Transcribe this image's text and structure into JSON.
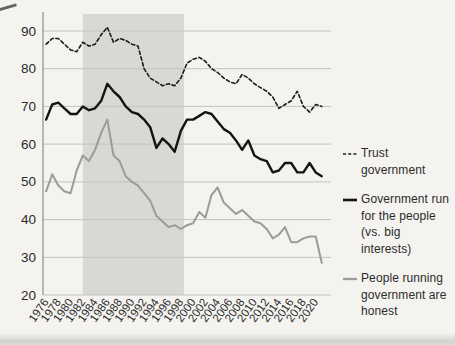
{
  "chart_data": {
    "type": "line",
    "x": [
      1976,
      1977,
      1978,
      1979,
      1980,
      1981,
      1982,
      1983,
      1984,
      1985,
      1986,
      1987,
      1988,
      1989,
      1990,
      1991,
      1992,
      1993,
      1994,
      1995,
      1996,
      1997,
      1998,
      1999,
      2000,
      2001,
      2002,
      2003,
      2004,
      2005,
      2006,
      2007,
      2008,
      2009,
      2010,
      2011,
      2012,
      2013,
      2014,
      2015,
      2016,
      2017,
      2018,
      2019,
      2020,
      2021
    ],
    "xticks": [
      1976,
      1978,
      1980,
      1982,
      1984,
      1986,
      1988,
      1990,
      1992,
      1994,
      1996,
      1998,
      2000,
      2002,
      2004,
      2006,
      2008,
      2010,
      2012,
      2014,
      2016,
      2018,
      2020
    ],
    "yticks": [
      20,
      30,
      40,
      50,
      60,
      70,
      80,
      90
    ],
    "xlim": [
      1975.5,
      2022.5
    ],
    "ylim": [
      20,
      90
    ],
    "grid": true,
    "legend_position": "right",
    "title": "",
    "xlabel": "",
    "ylabel": "",
    "shaded_band": {
      "from": 1982,
      "to": 1998.5,
      "color": "#d9d8d4"
    },
    "colors": {
      "background": "#f4f3f0",
      "grid": "#c3c2bf",
      "axis": "#96958f",
      "tick_text": "#2a2a2a"
    },
    "series": [
      {
        "id": "trust-government",
        "name": "Trust government",
        "style": "dashed",
        "color": "#1c1c1c",
        "values": [
          86.5,
          88,
          88,
          86.5,
          85,
          84.5,
          87,
          86,
          86.5,
          89,
          91,
          87,
          88,
          87.5,
          86.5,
          86,
          80,
          77.5,
          76.5,
          75.5,
          76,
          75.5,
          77.5,
          81.5,
          82.5,
          83,
          82,
          80,
          79,
          77.5,
          76.5,
          76,
          78.5,
          77.5,
          76,
          75,
          74,
          72.5,
          69.5,
          70.5,
          71.5,
          74,
          70,
          68.5,
          70.5,
          70
        ]
      },
      {
        "id": "government-run-for-people",
        "name": "Government run for the people (vs. big interests)",
        "style": "solid",
        "color": "#141414",
        "values": [
          66.5,
          70.5,
          71,
          69.5,
          68,
          68,
          70,
          69,
          69.5,
          71.5,
          76,
          74,
          72.5,
          70,
          68.5,
          68,
          66.5,
          64.5,
          59,
          61.5,
          60,
          58,
          63.5,
          66.5,
          66.5,
          67.5,
          68.5,
          68,
          66,
          64,
          63,
          61,
          58.5,
          61,
          57,
          56,
          55.5,
          52.5,
          53,
          55,
          55,
          52.5,
          52.5,
          55,
          52.5,
          51.5
        ]
      },
      {
        "id": "people-running-government-honest",
        "name": "People running government are honest",
        "style": "solid",
        "color": "#9c9b99",
        "values": [
          47.5,
          52,
          49,
          47.5,
          47,
          53,
          57,
          55.5,
          58.5,
          63,
          66.5,
          57,
          55.5,
          51.5,
          50,
          49,
          47,
          45,
          41,
          39.5,
          38,
          38.5,
          37.5,
          38.5,
          39,
          42,
          40.5,
          46.5,
          48.5,
          44.5,
          43,
          41.5,
          42.5,
          41,
          39.5,
          39,
          37.5,
          35,
          36,
          38,
          34,
          34,
          35,
          35.5,
          35.5,
          28.5
        ]
      }
    ]
  }
}
